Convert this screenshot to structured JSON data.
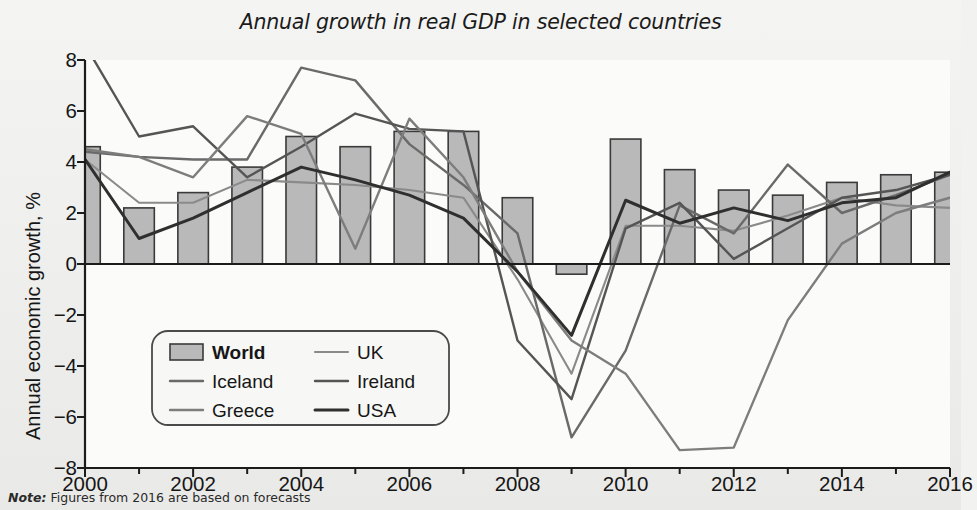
{
  "chart_data": {
    "type": "line",
    "title": "Annual growth in real GDP in selected countries",
    "xlabel": "",
    "ylabel": "Annual economic growth, %",
    "xlim": [
      2000,
      2016
    ],
    "ylim": [
      -8,
      8
    ],
    "grid": false,
    "legend_position": "inside-lower-left",
    "x": [
      2000,
      2001,
      2002,
      2003,
      2004,
      2005,
      2006,
      2007,
      2008,
      2009,
      2010,
      2011,
      2012,
      2013,
      2014,
      2015,
      2016
    ],
    "yticks": [
      -8,
      -6,
      -4,
      -2,
      0,
      2,
      4,
      6,
      8
    ],
    "ytick_labels": [
      "−8",
      "−6",
      "−4",
      "−2",
      "0",
      "2",
      "4",
      "6",
      "8"
    ],
    "xticks": [
      2000,
      2002,
      2004,
      2006,
      2008,
      2010,
      2012,
      2014,
      2016
    ],
    "xtick_labels": [
      "2000",
      "2002",
      "2004",
      "2006",
      "2008",
      "2010",
      "2012",
      "2014",
      "2016"
    ],
    "bar_series": {
      "name": "World",
      "values": [
        4.6,
        2.2,
        2.8,
        3.8,
        5.0,
        4.6,
        5.2,
        5.2,
        2.6,
        -0.4,
        4.9,
        3.7,
        2.9,
        2.7,
        3.2,
        3.5,
        3.6
      ]
    },
    "series": [
      {
        "name": "UK",
        "values": [
          4.1,
          2.4,
          2.4,
          3.3,
          2.5,
          2.8,
          2.6,
          2.6,
          -0.6,
          -4.3,
          1.5,
          1.5,
          1.3,
          1.9,
          3.1,
          2.2,
          2.2
        ]
      },
      {
        "name": "Iceland",
        "values": [
          4.3,
          3.9,
          0.1,
          2.4,
          7.7,
          7.2,
          4.7,
          9.5,
          1.5,
          -6.8,
          -3.4,
          2.0,
          1.2,
          3.9,
          2.0,
          4.1,
          4.3
        ]
      },
      {
        "name": "Ireland",
        "values": [
          9.9,
          5.0,
          5.4,
          3.4,
          4.6,
          5.9,
          5.5,
          5.0,
          -4.5,
          -5.3,
          2.3,
          0.0,
          -0.3,
          1.4,
          5.2,
          7.8,
          4.9
        ]
      },
      {
        "name": "Greece",
        "values": [
          4.5,
          4.2,
          3.4,
          5.8,
          5.1,
          0.6,
          5.7,
          3.3,
          -0.3,
          -4.3,
          -5.5,
          -9.1,
          -7.3,
          -3.2,
          0.7,
          -0.2,
          2.7
        ]
      },
      {
        "name": "USA",
        "values": [
          4.1,
          1.0,
          1.8,
          2.8,
          3.8,
          3.3,
          2.7,
          1.8,
          -0.3,
          -2.8,
          2.5,
          1.6,
          2.2,
          1.7,
          2.4,
          2.6,
          2.6
        ]
      }
    ],
    "series_display": [
      {
        "name": "UK",
        "points": [
          4.1,
          2.4,
          2.4,
          3.3,
          3.2,
          3.1,
          2.9,
          2.6,
          -0.6,
          -4.3,
          1.5,
          1.5,
          1.3,
          1.9,
          2.6,
          2.3,
          2.2
        ]
      },
      {
        "name": "Iceland",
        "points": [
          4.4,
          4.2,
          4.1,
          4.1,
          7.7,
          7.2,
          4.7,
          3.1,
          1.2,
          -6.8,
          -3.4,
          2.3,
          1.2,
          3.9,
          2.0,
          2.7,
          3.5
        ]
      },
      {
        "name": "Ireland",
        "points": [
          8.6,
          5.0,
          5.4,
          3.4,
          4.6,
          5.9,
          5.3,
          5.2,
          -3.0,
          -5.3,
          1.4,
          2.4,
          0.2,
          1.4,
          2.6,
          2.9,
          3.5
        ]
      },
      {
        "name": "Greece",
        "points": [
          4.5,
          4.2,
          3.4,
          5.8,
          5.1,
          0.6,
          5.7,
          3.4,
          -0.3,
          -3.0,
          -4.3,
          -7.3,
          -7.2,
          -2.2,
          0.8,
          2.0,
          2.6
        ]
      },
      {
        "name": "USA",
        "points": [
          4.1,
          1.0,
          1.8,
          2.8,
          3.8,
          3.3,
          2.7,
          1.8,
          -0.3,
          -2.8,
          2.5,
          1.6,
          2.2,
          1.7,
          2.4,
          2.6,
          3.6
        ]
      }
    ],
    "colors": {
      "bar_fill": "#b9b9b9",
      "bar_edge": "#3a3a3a",
      "uk": "#8a8a8a",
      "iceland": "#6a6a6a",
      "ireland": "#555555",
      "greece": "#7d7d7d",
      "usa": "#2f2f2f",
      "axis": "#1c1c1c"
    },
    "annotations": []
  },
  "legend": {
    "items": [
      {
        "label": "World",
        "type": "patch"
      },
      {
        "label": "UK",
        "type": "line"
      },
      {
        "label": "Iceland",
        "type": "line"
      },
      {
        "label": "Ireland",
        "type": "line"
      },
      {
        "label": "Greece",
        "type": "line"
      },
      {
        "label": "USA",
        "type": "line"
      }
    ]
  },
  "note": {
    "prefix": "Note:",
    "text": " Figures from 2016 are based on forecasts"
  }
}
